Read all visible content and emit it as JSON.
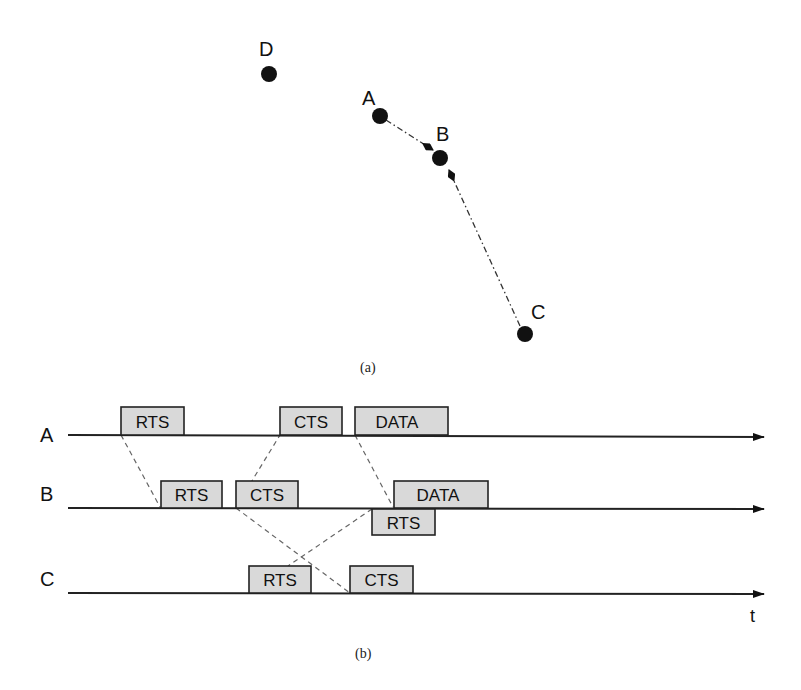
{
  "figure_a": {
    "caption": "(a)",
    "nodes": [
      {
        "id": "D",
        "label": "D"
      },
      {
        "id": "A",
        "label": "A"
      },
      {
        "id": "B",
        "label": "B"
      },
      {
        "id": "C",
        "label": "C"
      }
    ],
    "links": [
      {
        "from": "A",
        "to": "B",
        "style": "dash-dot",
        "arrow": "to"
      },
      {
        "from": "C",
        "to": "B",
        "style": "dash-dot",
        "arrow": "to"
      }
    ]
  },
  "figure_b": {
    "caption": "(b)",
    "time_axis_label": "t",
    "timelines": [
      {
        "id": "A",
        "label": "A",
        "frames": [
          {
            "label": "RTS",
            "side": "above"
          },
          {
            "label": "CTS",
            "side": "above"
          },
          {
            "label": "DATA",
            "side": "above"
          }
        ]
      },
      {
        "id": "B",
        "label": "B",
        "frames": [
          {
            "label": "RTS",
            "side": "above"
          },
          {
            "label": "CTS",
            "side": "above"
          },
          {
            "label": "DATA",
            "side": "above"
          },
          {
            "label": "RTS",
            "side": "below"
          }
        ]
      },
      {
        "id": "C",
        "label": "C",
        "frames": [
          {
            "label": "RTS",
            "side": "above"
          },
          {
            "label": "CTS",
            "side": "above"
          }
        ]
      }
    ],
    "propagation_lines": [
      {
        "from": "A.RTS",
        "to": "B.RTS"
      },
      {
        "from": "B.CTS",
        "to": "A.CTS"
      },
      {
        "from": "A.DATA",
        "to": "B.DATA"
      },
      {
        "from": "B.CTS",
        "to": "C.CTS"
      },
      {
        "from": "B.RTS(below)",
        "to": "C.RTS"
      }
    ]
  }
}
